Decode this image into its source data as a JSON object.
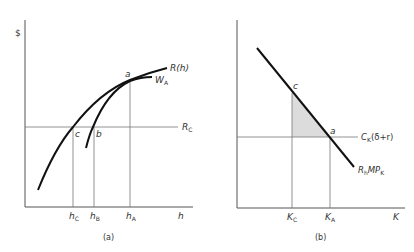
{
  "panels": [
    {
      "id": "a",
      "caption": "(a)",
      "y_axis_label": "$",
      "x_axis_label": "h",
      "curves": [
        {
          "name": "R(h)",
          "label": "R(h)"
        },
        {
          "name": "W_A",
          "label_main": "W",
          "label_sub": "A"
        }
      ],
      "horizontal_line": {
        "label_main": "R",
        "label_sub": "C"
      },
      "points": [
        {
          "name": "a",
          "label": "a"
        },
        {
          "name": "b",
          "label": "b"
        },
        {
          "name": "c",
          "label": "c"
        }
      ],
      "x_ticks": [
        {
          "main": "h",
          "sub": "C"
        },
        {
          "main": "h",
          "sub": "B"
        },
        {
          "main": "h",
          "sub": "A"
        }
      ]
    },
    {
      "id": "b",
      "caption": "(b)",
      "x_axis_label": "K",
      "curves": [
        {
          "name": "R_h MP_K",
          "label_r": "R",
          "label_r_sub": "h",
          "label_mp": "MP",
          "label_mp_sub": "K"
        }
      ],
      "horizontal_line": {
        "label_main": "C",
        "label_sub": "K",
        "label_rest": "(δ+r)"
      },
      "points": [
        {
          "name": "c",
          "label": "c"
        },
        {
          "name": "a",
          "label": "a"
        }
      ],
      "x_ticks": [
        {
          "main": "K",
          "sub": "C"
        },
        {
          "main": "K",
          "sub": "A"
        }
      ],
      "shaded_region_color": "#e0e0e0"
    }
  ],
  "colors": {
    "curve": "#111111",
    "thin_line": "#666666",
    "text": "#333333",
    "shade": "#dcdcdc"
  }
}
